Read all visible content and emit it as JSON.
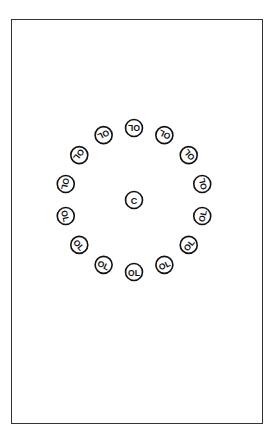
{
  "diagram": {
    "center_label": "C",
    "ring_label": "OL",
    "ring_count": 14,
    "center": {
      "x": 134,
      "y": 200
    },
    "radius_x": 70,
    "radius_y": 72,
    "marker_radius": 8.5,
    "stroke_color": "#111111",
    "frame_color": "#333333"
  }
}
